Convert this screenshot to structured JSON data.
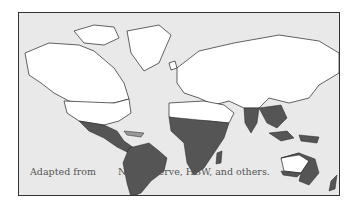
{
  "map": {
    "title": "Species distribution world map",
    "caption_prefix": "Adapted from",
    "caption_sources": "NatureServe, HBW, and others.",
    "colors": {
      "ocean": "#e9e9e9",
      "land_absent": "#ffffff",
      "range_present": "#555555",
      "border": "#222222",
      "frame": "#333333"
    },
    "legend": {
      "shaded": "distribution range",
      "white": "absent"
    },
    "regions_shaded": [
      "Mexico",
      "Central America",
      "Caribbean",
      "South America",
      "Sub-Saharan Africa",
      "Madagascar",
      "South Asia",
      "Southeast Asia",
      "Indonesia",
      "New Guinea",
      "Northern & Eastern Australia",
      "Pacific Islands"
    ]
  }
}
